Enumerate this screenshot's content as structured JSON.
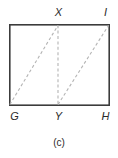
{
  "figure": {
    "caption": "(c)",
    "shape_name": "rectangle",
    "colors": {
      "background": "#ffffff",
      "outline": "#3c3c3c",
      "dashed_line": "#b4b4b4",
      "label_text": "#2b2b2b"
    },
    "outline": {
      "stroke_width": 1.6,
      "corners": {
        "top_left": [
          9,
          24
        ],
        "top_right": [
          109,
          24
        ],
        "bottom_right": [
          109,
          105
        ],
        "bottom_left": [
          9,
          105
        ]
      }
    },
    "vertices": [
      {
        "id": "X",
        "label": "X",
        "x": 58,
        "y": 24,
        "position": "top-middle",
        "label_x": 58,
        "label_y": 13
      },
      {
        "id": "I",
        "label": "I",
        "x": 109,
        "y": 24,
        "position": "top-right",
        "label_x": 105,
        "label_y": 13
      },
      {
        "id": "G",
        "label": "G",
        "x": 9,
        "y": 105,
        "position": "bottom-left",
        "label_x": 14,
        "label_y": 117
      },
      {
        "id": "Y",
        "label": "Y",
        "x": 58,
        "y": 105,
        "position": "bottom-middle",
        "label_x": 58,
        "label_y": 117
      },
      {
        "id": "H",
        "label": "H",
        "x": 109,
        "y": 105,
        "position": "bottom-right",
        "label_x": 105,
        "label_y": 117
      }
    ],
    "dashed_segments": [
      {
        "id": "G-X",
        "from": "G",
        "to": "X",
        "x1": 9,
        "y1": 105,
        "x2": 58,
        "y2": 24,
        "kind": "diagonal"
      },
      {
        "id": "X-Y",
        "from": "X",
        "to": "Y",
        "x1": 58,
        "y1": 24,
        "x2": 58,
        "y2": 105,
        "kind": "vertical"
      },
      {
        "id": "Y-I",
        "from": "Y",
        "to": "I",
        "x1": 58,
        "y1": 105,
        "x2": 109,
        "y2": 24,
        "kind": "diagonal"
      }
    ],
    "dash_pattern": "3 2.4",
    "dash_stroke_width": 1.1
  }
}
